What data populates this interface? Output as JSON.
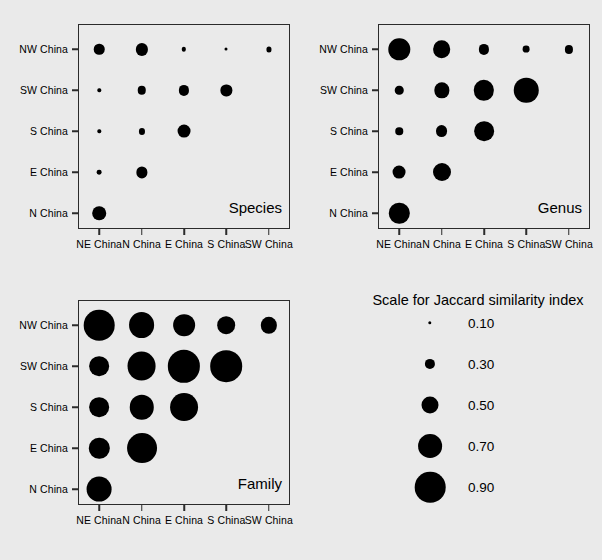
{
  "figure": {
    "background_color": "#eaeaea",
    "bubble_color": "#000000",
    "axis_color": "#2b2b2b"
  },
  "chart_data": {
    "type": "scatter",
    "title": "",
    "subtitle": "",
    "xlabel": "",
    "ylabel": "",
    "grid": false,
    "legend_position": "bottom-right",
    "value_label": "Jaccard similarity index",
    "size_encoding": "bubble area/diameter proportional to Jaccard similarity index",
    "diameter_px_per_unit": 34,
    "x_categories": [
      "NE China",
      "N China",
      "E China",
      "S China",
      "SW China"
    ],
    "y_categories": [
      "NW China",
      "SW China",
      "S China",
      "E China",
      "N China"
    ],
    "panels": [
      {
        "name": "species",
        "label": "Species",
        "rows": [
          {
            "y": "NW China",
            "points": [
              {
                "x": "NE China",
                "value": 0.31
              },
              {
                "x": "N China",
                "value": 0.36
              },
              {
                "x": "E China",
                "value": 0.13
              },
              {
                "x": "S China",
                "value": 0.09
              },
              {
                "x": "SW China",
                "value": 0.15
              }
            ]
          },
          {
            "y": "SW China",
            "points": [
              {
                "x": "NE China",
                "value": 0.1
              },
              {
                "x": "N China",
                "value": 0.25
              },
              {
                "x": "E China",
                "value": 0.3
              },
              {
                "x": "S China",
                "value": 0.33
              }
            ]
          },
          {
            "y": "S China",
            "points": [
              {
                "x": "NE China",
                "value": 0.1
              },
              {
                "x": "N China",
                "value": 0.18
              },
              {
                "x": "E China",
                "value": 0.38
              }
            ]
          },
          {
            "y": "E China",
            "points": [
              {
                "x": "NE China",
                "value": 0.14
              },
              {
                "x": "N China",
                "value": 0.33
              }
            ]
          },
          {
            "y": "N China",
            "points": [
              {
                "x": "NE China",
                "value": 0.4
              }
            ]
          }
        ]
      },
      {
        "name": "genus",
        "label": "Genus",
        "rows": [
          {
            "y": "NW China",
            "points": [
              {
                "x": "NE China",
                "value": 0.63
              },
              {
                "x": "N China",
                "value": 0.52
              },
              {
                "x": "E China",
                "value": 0.3
              },
              {
                "x": "S China",
                "value": 0.2
              },
              {
                "x": "SW China",
                "value": 0.24
              }
            ]
          },
          {
            "y": "SW China",
            "points": [
              {
                "x": "NE China",
                "value": 0.25
              },
              {
                "x": "N China",
                "value": 0.45
              },
              {
                "x": "E China",
                "value": 0.6
              },
              {
                "x": "S China",
                "value": 0.72
              }
            ]
          },
          {
            "y": "S China",
            "points": [
              {
                "x": "NE China",
                "value": 0.22
              },
              {
                "x": "N China",
                "value": 0.35
              },
              {
                "x": "E China",
                "value": 0.58
              }
            ]
          },
          {
            "y": "E China",
            "points": [
              {
                "x": "NE China",
                "value": 0.38
              },
              {
                "x": "N China",
                "value": 0.53
              }
            ]
          },
          {
            "y": "N China",
            "points": [
              {
                "x": "NE China",
                "value": 0.6
              }
            ]
          }
        ]
      },
      {
        "name": "family",
        "label": "Family",
        "rows": [
          {
            "y": "NW China",
            "points": [
              {
                "x": "NE China",
                "value": 0.9
              },
              {
                "x": "N China",
                "value": 0.76
              },
              {
                "x": "E China",
                "value": 0.64
              },
              {
                "x": "S China",
                "value": 0.52
              },
              {
                "x": "SW China",
                "value": 0.48
              }
            ]
          },
          {
            "y": "SW China",
            "points": [
              {
                "x": "NE China",
                "value": 0.58
              },
              {
                "x": "N China",
                "value": 0.85
              },
              {
                "x": "E China",
                "value": 0.95
              },
              {
                "x": "S China",
                "value": 0.93
              }
            ]
          },
          {
            "y": "S China",
            "points": [
              {
                "x": "NE China",
                "value": 0.58
              },
              {
                "x": "N China",
                "value": 0.72
              },
              {
                "x": "E China",
                "value": 0.82
              }
            ]
          },
          {
            "y": "E China",
            "points": [
              {
                "x": "NE China",
                "value": 0.6
              },
              {
                "x": "N China",
                "value": 0.88
              }
            ]
          },
          {
            "y": "N China",
            "points": [
              {
                "x": "NE China",
                "value": 0.73
              }
            ]
          }
        ]
      }
    ],
    "legend": {
      "title": "Scale for Jaccard similarity index",
      "entries": [
        {
          "label": "0.10",
          "value": 0.1
        },
        {
          "label": "0.30",
          "value": 0.3
        },
        {
          "label": "0.50",
          "value": 0.5
        },
        {
          "label": "0.70",
          "value": 0.7
        },
        {
          "label": "0.90",
          "value": 0.9
        }
      ]
    }
  }
}
